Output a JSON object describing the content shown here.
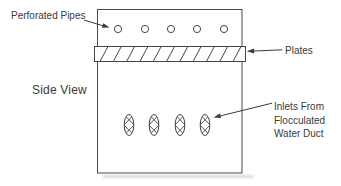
{
  "figure": {
    "view_label": "Side View",
    "annotations": {
      "perforated_pipes": "Perforated Pipes",
      "plates": "Plates",
      "inlets_line_1": "Inlets From",
      "inlets_line_2": "Flocculated",
      "inlets_line_3": "Water Duct"
    },
    "counts": {
      "perforated_pipe_holes": 5,
      "inlet_ducts": 4
    },
    "colors": {
      "background": "#ffffff",
      "line_ink": "#454545",
      "text_ink": "#3a3a3a"
    }
  }
}
